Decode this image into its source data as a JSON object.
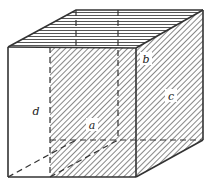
{
  "figure": {
    "name": "cuboid-diagram",
    "type": "geometry-illustration",
    "labels": {
      "a": "a",
      "b": "b",
      "c": "c",
      "d": "d"
    },
    "colors": {
      "edge": "#333333",
      "hidden_edge": "#333333",
      "hatch_line": "#555555",
      "face_fill": "#ffffff",
      "background": "#ffffff",
      "label": "#1a1a1a"
    },
    "geometry": {
      "front_top_left": [
        8,
        47
      ],
      "front_top_right": [
        136,
        48
      ],
      "front_bottom_left": [
        8,
        177
      ],
      "front_bottom_right": [
        136,
        177
      ],
      "back_top_left": [
        76,
        10
      ],
      "back_top_right": [
        203,
        10
      ],
      "back_bottom_left": [
        76,
        140
      ],
      "back_bottom_right": [
        203,
        140
      ],
      "mid_front_x": 50,
      "mid_back_x": 118
    },
    "faces": [
      {
        "id": "left-face",
        "label": "d",
        "hatched": false
      },
      {
        "id": "front-face",
        "label": "a",
        "hatched": true
      },
      {
        "id": "right-face",
        "label": "c",
        "hatched": true
      },
      {
        "id": "top-face",
        "label": "b",
        "hatched": true
      }
    ],
    "label_positions": {
      "a": [
        91,
        127
      ],
      "b": [
        146,
        62
      ],
      "c": [
        171,
        99
      ],
      "d": [
        36,
        111
      ]
    }
  }
}
